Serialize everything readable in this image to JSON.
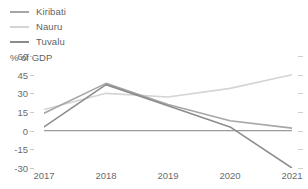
{
  "chart_data": {
    "type": "line",
    "title": "",
    "subtitle": "",
    "xlabel": "",
    "ylabel": "% of GDP",
    "categories": [
      "2017",
      "2018",
      "2019",
      "2020",
      "2021"
    ],
    "x": [
      2017,
      2018,
      2019,
      2020,
      2021
    ],
    "ylim": [
      -30,
      60
    ],
    "yticks": [
      60,
      45,
      30,
      15,
      0,
      -15,
      -30
    ],
    "ytick_labels": [
      "60",
      "45",
      "30",
      "15",
      "0",
      "-15",
      "-30"
    ],
    "grid": false,
    "legend_position": "top-left",
    "zero_line": 0,
    "series": [
      {
        "name": "Kiribati",
        "color": "#a6a6a6",
        "values": [
          14,
          38,
          21,
          8,
          2
        ]
      },
      {
        "name": "Nauru",
        "color": "#d4d4d4",
        "values": [
          17,
          30,
          27,
          34,
          45
        ]
      },
      {
        "name": "Tuvalu",
        "color": "#8c8c8c",
        "values": [
          3,
          37,
          20,
          3,
          -30
        ]
      }
    ]
  },
  "legend": {
    "items": [
      {
        "label": "Kiribati",
        "color": "#a6a6a6"
      },
      {
        "label": "Nauru",
        "color": "#d4d4d4"
      },
      {
        "label": "Tuvalu",
        "color": "#8c8c8c"
      }
    ]
  },
  "axes": {
    "y_title": "% of GDP",
    "y_labels": [
      "60",
      "45",
      "30",
      "15",
      "0",
      "-15",
      "-30"
    ],
    "x_labels": [
      "2017",
      "2018",
      "2019",
      "2020",
      "2021"
    ]
  },
  "colors": {
    "text": "#6b6b6b",
    "axis": "#bfbfbf",
    "zero_line": "#9a9a9a",
    "background": "#ffffff"
  }
}
